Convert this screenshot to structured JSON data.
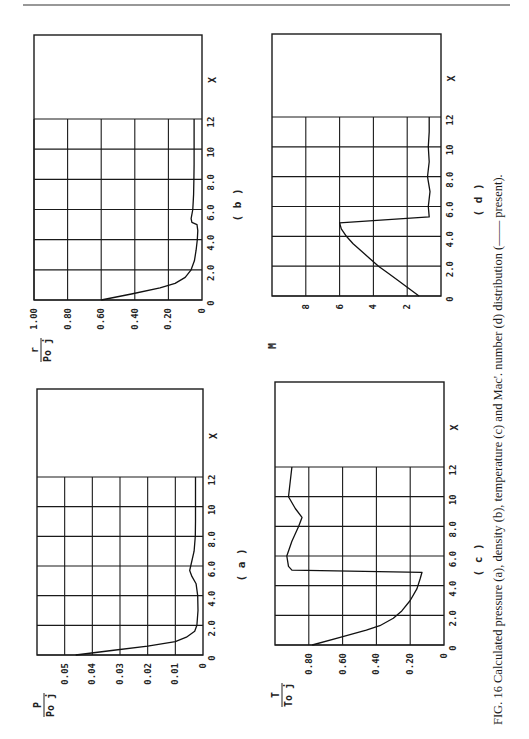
{
  "figure": {
    "caption": "FIG. 16  Calculated pressure (a), density (b), temperature (c) and Mac'. number (d) distribution (—— present).",
    "orientation": "rotated 90° counter-clockwise (landscape figure on portrait page)"
  },
  "chart_data": [
    {
      "id": "a",
      "type": "line",
      "panel_label": "( a )",
      "title": "Calculated pressure distribution",
      "xlabel": "X",
      "ylabel_num": "P",
      "ylabel_den": "Po j",
      "xlim": [
        0,
        12
      ],
      "ylim": [
        0,
        0.06
      ],
      "x_ticks": [
        "0",
        "2.0",
        "4.0",
        "6.0",
        "8.0",
        "10",
        "12"
      ],
      "y_ticks": [
        "0.05",
        "0.04",
        "0.03",
        "0.02",
        "0.01",
        "0"
      ],
      "x_tick_values": [
        0,
        2,
        4,
        6,
        8,
        10,
        12
      ],
      "y_tick_values": [
        0.05,
        0.04,
        0.03,
        0.02,
        0.01,
        0
      ],
      "grid": true,
      "series": [
        {
          "name": "present",
          "x": [
            0,
            0.3,
            0.6,
            0.9,
            1.2,
            1.6,
            2.0,
            3.0,
            4.0,
            4.8,
            5.3,
            5.7,
            6.2,
            7.0,
            8.0,
            9.0,
            10.0,
            11.0,
            12.0
          ],
          "y": [
            0.046,
            0.033,
            0.02,
            0.01,
            0.006,
            0.003,
            0.0022,
            0.0018,
            0.0019,
            0.0025,
            0.004,
            0.0048,
            0.0042,
            0.0032,
            0.0028,
            0.0027,
            0.0027,
            0.0027,
            0.0027
          ]
        }
      ]
    },
    {
      "id": "b",
      "type": "line",
      "panel_label": "( b )",
      "title": "Calculated density distribution",
      "xlabel": "X",
      "ylabel_num": "r",
      "ylabel_den": "Po j",
      "xlim": [
        0,
        12
      ],
      "ylim": [
        0,
        1.0
      ],
      "x_ticks": [
        "0",
        "2.0",
        "4.0",
        "6.0",
        "8.0",
        "10",
        "12"
      ],
      "y_ticks": [
        "1.00",
        "0.80",
        "0.60",
        "0.40",
        "0.20",
        "0"
      ],
      "x_tick_values": [
        0,
        2,
        4,
        6,
        8,
        10,
        12
      ],
      "y_tick_values": [
        1.0,
        0.8,
        0.6,
        0.4,
        0.2,
        0
      ],
      "grid": true,
      "series": [
        {
          "name": "present",
          "x": [
            0,
            0.4,
            0.8,
            1.1,
            1.5,
            2.0,
            2.6,
            3.3,
            4.0,
            4.6,
            5.0,
            5.15,
            5.4,
            6.0,
            7.0,
            8.0,
            9.0,
            10.0,
            11.0,
            12.0
          ],
          "y": [
            0.6,
            0.42,
            0.25,
            0.16,
            0.1,
            0.065,
            0.045,
            0.035,
            0.028,
            0.025,
            0.03,
            0.06,
            0.065,
            0.055,
            0.05,
            0.048,
            0.047,
            0.047,
            0.047,
            0.047
          ]
        }
      ]
    },
    {
      "id": "c",
      "type": "line",
      "panel_label": "( c )",
      "title": "Calculated temperature distribution",
      "xlabel": "X",
      "ylabel_num": "T",
      "ylabel_den": "To j",
      "xlim": [
        0,
        12
      ],
      "ylim": [
        0,
        1.0
      ],
      "x_ticks": [
        "0",
        "2.0",
        "4.0",
        "6.0",
        "8.0",
        "10",
        "12"
      ],
      "y_ticks": [
        "0.80",
        "0.60",
        "0.40",
        "0.20",
        "0"
      ],
      "x_tick_values": [
        0,
        2,
        4,
        6,
        8,
        10,
        12
      ],
      "y_tick_values": [
        0.8,
        0.6,
        0.4,
        0.2,
        0
      ],
      "grid": true,
      "series": [
        {
          "name": "present",
          "x": [
            0,
            0.5,
            1.0,
            1.3,
            1.8,
            2.3,
            3.0,
            3.8,
            4.5,
            4.9,
            5.05,
            5.3,
            6.0,
            7.0,
            8.0,
            8.6,
            9.2,
            10.0,
            11.0,
            12.0
          ],
          "y": [
            0.78,
            0.62,
            0.46,
            0.38,
            0.3,
            0.25,
            0.2,
            0.16,
            0.14,
            0.13,
            0.9,
            0.92,
            0.93,
            0.9,
            0.86,
            0.84,
            0.88,
            0.92,
            0.91,
            0.9
          ]
        }
      ]
    },
    {
      "id": "d",
      "type": "line",
      "panel_label": "( d )",
      "title": "Calculated Mach number distribution",
      "xlabel": "X",
      "ylabel_num": "M",
      "ylabel_den": "",
      "xlim": [
        0,
        12
      ],
      "ylim": [
        0,
        10
      ],
      "x_ticks": [
        "0",
        "2.0",
        "4.0",
        "6.0",
        "8.0",
        "10",
        "12"
      ],
      "y_ticks": [
        "8",
        "6",
        "4",
        "2"
      ],
      "x_tick_values": [
        0,
        2,
        4,
        6,
        8,
        10,
        12
      ],
      "y_tick_values": [
        8,
        6,
        4,
        2
      ],
      "grid": true,
      "series": [
        {
          "name": "present",
          "x": [
            0,
            0.5,
            1.0,
            1.5,
            2.0,
            2.5,
            3.0,
            3.5,
            4.0,
            4.5,
            4.9,
            5.3,
            6.0,
            7.0,
            8.0,
            9.0,
            10.0,
            11.0,
            12.0
          ],
          "y": [
            1.3,
            1.9,
            2.5,
            3.1,
            3.7,
            4.2,
            4.7,
            5.2,
            5.6,
            5.9,
            6.0,
            0.7,
            0.75,
            0.65,
            0.8,
            0.7,
            0.75,
            0.7,
            0.7
          ]
        }
      ]
    }
  ]
}
